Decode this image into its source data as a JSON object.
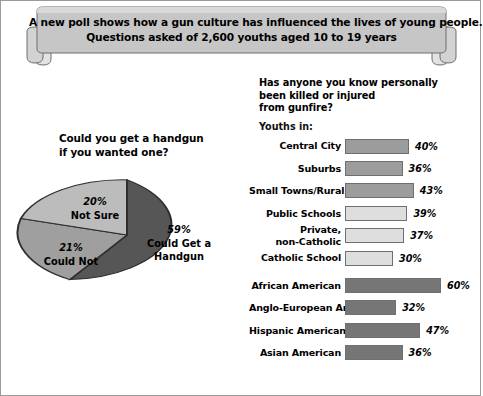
{
  "banner": {
    "line1": "A new poll shows how a gun culture has influenced the lives of young people.",
    "line2": "Questions asked of 2,600 youths aged 10 to 19 years"
  },
  "pie_section": {
    "title_line1": "Could you get a handgun",
    "title_line2": "if you wanted one?"
  },
  "bars_section": {
    "title_line1": "Has anyone you know personally",
    "title_line2": "been killed or injured",
    "title_line3": "from gunfire?",
    "group_label": "Youths in:"
  },
  "colors": {
    "pie_dark": "#565656",
    "pie_medium": "#9f9f9f",
    "pie_light": "#bcbcbc",
    "bar_medium": "#9c9c9c",
    "bar_light": "#dedede",
    "bar_dark": "#767676",
    "banner_fill": "#c6c6c6",
    "outline": "#6f6f6f"
  },
  "chart_data": [
    {
      "type": "pie",
      "title": "Could you get a handgun if you wanted one?",
      "labels": [
        "Could Get a Handgun",
        "Could Not",
        "Not Sure"
      ],
      "values": [
        59,
        21,
        20
      ],
      "value_labels": [
        "59%",
        "21%",
        "20%"
      ],
      "units": "percent",
      "legend": "none (slices labeled in place)",
      "slice_colors": [
        "#565656",
        "#9f9f9f",
        "#bcbcbc"
      ]
    },
    {
      "type": "bar",
      "orientation": "horizontal",
      "title": "Has anyone you know personally been killed or injured from gunfire?",
      "group_label": "Youths in:",
      "xlabel": "",
      "ylabel": "",
      "xlim": [
        0,
        60
      ],
      "grid": false,
      "legend": "none",
      "categories": [
        "Central City",
        "Suburbs",
        "Small Towns/Rural",
        "Public Schools",
        "Private, non-Catholic",
        "Catholic School",
        "African American",
        "Anglo-European American",
        "Hispanic American or Latino",
        "Asian American"
      ],
      "values": [
        40,
        36,
        43,
        39,
        37,
        30,
        60,
        32,
        47,
        36
      ],
      "value_labels": [
        "40%",
        "36%",
        "43%",
        "39%",
        "37%",
        "30%",
        "60%",
        "32%",
        "47%",
        "36%"
      ]
    }
  ],
  "bars": [
    {
      "label": "Central City",
      "label_line1": "Central City",
      "label_line2": "",
      "value": 40,
      "value_label": "40%",
      "color": "#9c9c9c",
      "gap_before": false
    },
    {
      "label": "Suburbs",
      "label_line1": "Suburbs",
      "label_line2": "",
      "value": 36,
      "value_label": "36%",
      "color": "#9c9c9c",
      "gap_before": false
    },
    {
      "label": "Small Towns/Rural",
      "label_line1": "Small Towns/Rural",
      "label_line2": "",
      "value": 43,
      "value_label": "43%",
      "color": "#9c9c9c",
      "gap_before": false
    },
    {
      "label": "Public Schools",
      "label_line1": "Public Schools",
      "label_line2": "",
      "value": 39,
      "value_label": "39%",
      "color": "#dedede",
      "gap_before": false
    },
    {
      "label": "Private, non-Catholic",
      "label_line1": "Private,",
      "label_line2": "non-Catholic",
      "value": 37,
      "value_label": "37%",
      "color": "#dedede",
      "gap_before": false
    },
    {
      "label": "Catholic School",
      "label_line1": "Catholic School",
      "label_line2": "",
      "value": 30,
      "value_label": "30%",
      "color": "#dedede",
      "gap_before": false
    },
    {
      "label": "African American",
      "label_line1": "African American",
      "label_line2": "",
      "value": 60,
      "value_label": "60%",
      "color": "#767676",
      "gap_before": true
    },
    {
      "label": "Anglo-European American",
      "label_line1": "Anglo-European American",
      "label_line2": "",
      "value": 32,
      "value_label": "32%",
      "color": "#767676",
      "gap_before": false
    },
    {
      "label": "Hispanic American or Latino",
      "label_line1": "Hispanic American or Latino",
      "label_line2": "",
      "value": 47,
      "value_label": "47%",
      "color": "#767676",
      "gap_before": false
    },
    {
      "label": "Asian American",
      "label_line1": "Asian American",
      "label_line2": "",
      "value": 36,
      "value_label": "36%",
      "color": "#767676",
      "gap_before": false
    }
  ],
  "pie_slices": [
    {
      "name": "Not Sure",
      "value": 20,
      "value_label": "20%",
      "color": "#bcbcbc"
    },
    {
      "name": "Could Not",
      "value": 21,
      "value_label": "21%",
      "color": "#9f9f9f"
    },
    {
      "name": "Could Get a Handgun",
      "value": 59,
      "value_label": "59%",
      "color": "#565656"
    }
  ]
}
